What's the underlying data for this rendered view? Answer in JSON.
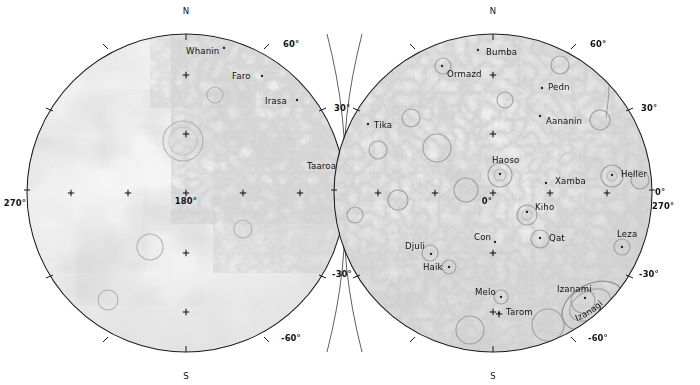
{
  "figure": {
    "type": "planetary-hemisphere-map",
    "background_color": "#ffffff",
    "line_color": "#1b1b1b",
    "text_color": "#111111",
    "terrain_light": "#f2f2f2",
    "terrain_mid": "#c9c9c9",
    "terrain_dark": "#9a9a9a"
  },
  "hemispheres": [
    {
      "id": "left-hemisphere",
      "name": "left-hemisphere",
      "center_x": 186,
      "center_y": 193,
      "radius": 159,
      "center_label": "180°",
      "cardinals": [
        {
          "name": "north-label",
          "text": "N",
          "x": 186,
          "y": 14
        },
        {
          "name": "south-label",
          "text": "S",
          "x": 186,
          "y": 379
        }
      ],
      "graticule_labels": [
        {
          "name": "lat-60-north",
          "text": "60°",
          "x": 283,
          "y": 47,
          "anchor": "start"
        },
        {
          "name": "lat-30-north",
          "text": "30°",
          "x": 334,
          "y": 111,
          "anchor": "start"
        },
        {
          "name": "lon-90",
          "text": "90°",
          "x": 345,
          "y": 205,
          "anchor": "start"
        },
        {
          "name": "lat-30-south",
          "text": "-30°",
          "x": 332,
          "y": 277,
          "anchor": "start"
        },
        {
          "name": "lat-60-south",
          "text": "-60°",
          "x": 281,
          "y": 341,
          "anchor": "start"
        },
        {
          "name": "lon-270",
          "text": "270°",
          "x": 26,
          "y": 206,
          "anchor": "end"
        }
      ],
      "features": [
        {
          "name": "feature-whanin",
          "text": "Whanin",
          "x": 186,
          "y": 54,
          "anchor": "start",
          "dot_x": 224,
          "dot_y": 48
        },
        {
          "name": "feature-faro",
          "text": "Faro",
          "x": 232,
          "y": 79,
          "anchor": "start",
          "dot_x": 262,
          "dot_y": 76
        },
        {
          "name": "feature-irasa",
          "text": "Irasa",
          "x": 265,
          "y": 104,
          "anchor": "start",
          "dot_x": 297,
          "dot_y": 100
        },
        {
          "name": "feature-taaroa",
          "text": "Taaroa",
          "x": 307,
          "y": 169,
          "anchor": "start",
          "dot_x": 341,
          "dot_y": 166
        }
      ],
      "crosses": [
        {
          "x": 186,
          "y": 75
        },
        {
          "x": 186,
          "y": 134
        },
        {
          "x": 186,
          "y": 193
        },
        {
          "x": 186,
          "y": 253
        },
        {
          "x": 186,
          "y": 312
        },
        {
          "x": 71,
          "y": 193
        },
        {
          "x": 128,
          "y": 193
        },
        {
          "x": 243,
          "y": 193
        },
        {
          "x": 300,
          "y": 193
        }
      ]
    },
    {
      "id": "right-hemisphere",
      "name": "right-hemisphere",
      "center_x": 493,
      "center_y": 193,
      "radius": 159,
      "center_label": "0°",
      "cardinals": [
        {
          "name": "north-label",
          "text": "N",
          "x": 493,
          "y": 14
        },
        {
          "name": "south-label",
          "text": "S",
          "x": 493,
          "y": 379
        }
      ],
      "graticule_labels": [
        {
          "name": "lat-60-north",
          "text": "60°",
          "x": 590,
          "y": 47,
          "anchor": "start"
        },
        {
          "name": "lat-30-north",
          "text": "30°",
          "x": 641,
          "y": 111,
          "anchor": "start"
        },
        {
          "name": "lon-0",
          "text": "0°",
          "x": 655,
          "y": 195,
          "anchor": "start"
        },
        {
          "name": "lon-270",
          "text": "270°",
          "x": 652,
          "y": 209,
          "anchor": "start"
        },
        {
          "name": "lat-30-south",
          "text": "-30°",
          "x": 639,
          "y": 277,
          "anchor": "start"
        },
        {
          "name": "lat-60-south",
          "text": "-60°",
          "x": 588,
          "y": 341,
          "anchor": "start"
        }
      ],
      "features": [
        {
          "name": "feature-bumba",
          "text": "Bumba",
          "x": 486,
          "y": 55,
          "anchor": "start",
          "dot_x": 478,
          "dot_y": 50
        },
        {
          "name": "feature-ormazd",
          "text": "Ormazd",
          "x": 447,
          "y": 77,
          "anchor": "start",
          "dot_x": 442,
          "dot_y": 66
        },
        {
          "name": "feature-pedn",
          "text": "Pedn",
          "x": 548,
          "y": 90,
          "anchor": "start",
          "dot_x": 542,
          "dot_y": 88
        },
        {
          "name": "feature-aananin",
          "text": "Aananin",
          "x": 546,
          "y": 124,
          "anchor": "start",
          "dot_x": 540,
          "dot_y": 116
        },
        {
          "name": "feature-tika",
          "text": "Tika",
          "x": 374,
          "y": 128,
          "anchor": "start",
          "dot_x": 368,
          "dot_y": 124
        },
        {
          "name": "feature-haoso",
          "text": "Haoso",
          "x": 492,
          "y": 163,
          "anchor": "start",
          "dot_x": 500,
          "dot_y": 174
        },
        {
          "name": "feature-xamba",
          "text": "Xamba",
          "x": 555,
          "y": 184,
          "anchor": "start",
          "dot_x": 546,
          "dot_y": 183
        },
        {
          "name": "feature-heller",
          "text": "Heller",
          "x": 621,
          "y": 177,
          "anchor": "start",
          "dot_x": 612,
          "dot_y": 175
        },
        {
          "name": "feature-kiho",
          "text": "Kiho",
          "x": 535,
          "y": 210,
          "anchor": "start",
          "dot_x": 527,
          "dot_y": 212
        },
        {
          "name": "feature-con",
          "text": "Con",
          "x": 474,
          "y": 240,
          "anchor": "start",
          "dot_x": 495,
          "dot_y": 242
        },
        {
          "name": "feature-qat",
          "text": "Qat",
          "x": 549,
          "y": 241,
          "anchor": "start",
          "dot_x": 540,
          "dot_y": 238
        },
        {
          "name": "feature-leza",
          "text": "Leza",
          "x": 617,
          "y": 237,
          "anchor": "start",
          "dot_x": 622,
          "dot_y": 247
        },
        {
          "name": "feature-djuli",
          "text": "Djuli",
          "x": 405,
          "y": 249,
          "anchor": "start",
          "dot_x": 431,
          "dot_y": 254
        },
        {
          "name": "feature-haik",
          "text": "Haik",
          "x": 423,
          "y": 270,
          "anchor": "start",
          "dot_x": 449,
          "dot_y": 267
        },
        {
          "name": "feature-melo",
          "text": "Melo",
          "x": 475,
          "y": 295,
          "anchor": "start",
          "dot_x": 501,
          "dot_y": 297
        },
        {
          "name": "feature-izanami",
          "text": "Izanami",
          "x": 557,
          "y": 292,
          "anchor": "start",
          "dot_x": 585,
          "dot_y": 298
        },
        {
          "name": "feature-tarom",
          "text": "Tarom",
          "x": 506,
          "y": 315,
          "anchor": "start",
          "dot_x": 499,
          "dot_y": 313
        }
      ],
      "curved_features": [
        {
          "name": "feature-izanagi",
          "text": "Izanagi",
          "path_id": "izanagi-arc"
        }
      ],
      "crosses": [
        {
          "x": 493,
          "y": 75
        },
        {
          "x": 493,
          "y": 134
        },
        {
          "x": 493,
          "y": 193
        },
        {
          "x": 493,
          "y": 253
        },
        {
          "x": 493,
          "y": 312
        },
        {
          "x": 378,
          "y": 193
        },
        {
          "x": 435,
          "y": 193
        },
        {
          "x": 550,
          "y": 193
        },
        {
          "x": 607,
          "y": 193
        },
        {
          "x": 499,
          "y": 314
        }
      ]
    }
  ]
}
